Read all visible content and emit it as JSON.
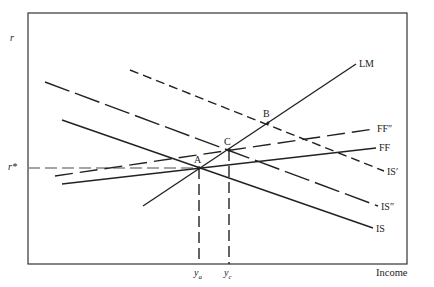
{
  "diagram": {
    "type": "IS-LM-FF macroeconomic diagram",
    "axes": {
      "y_label": "r",
      "x_label": "Income",
      "r_star_label": "r*",
      "ya_label": "y",
      "ya_sub": "a",
      "yc_label": "y",
      "yc_sub": "c"
    },
    "curves": [
      {
        "name": "LM",
        "label": "LM",
        "style": "solid"
      },
      {
        "name": "FF",
        "label": "FF",
        "style": "solid"
      },
      {
        "name": "FF''",
        "label": "FF″",
        "style": "long-dash"
      },
      {
        "name": "IS",
        "label": "IS",
        "style": "solid"
      },
      {
        "name": "IS''",
        "label": "IS″",
        "style": "long-dash"
      },
      {
        "name": "IS'",
        "label": "IS′",
        "style": "short-dash"
      }
    ],
    "points": {
      "A": "A",
      "B": "B",
      "C": "C"
    },
    "colors": {
      "line": "#222222",
      "r_star_guide": "#888888",
      "frame": "#333333"
    }
  }
}
